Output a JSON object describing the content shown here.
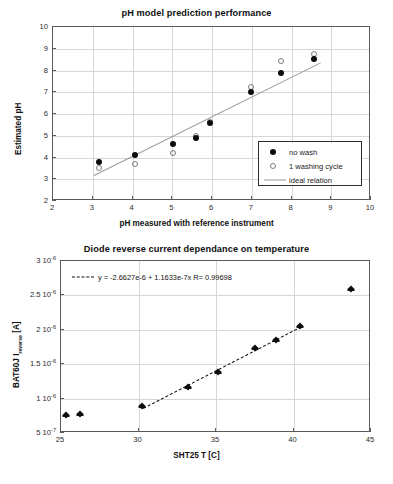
{
  "chart_data": [
    {
      "type": "scatter",
      "title": "pH model prediction performance",
      "xlabel": "pH measured with reference instrument",
      "ylabel": "Estimated pH",
      "xlim": [
        2,
        10
      ],
      "ylim": [
        2,
        10
      ],
      "xticks": [
        "2",
        "3",
        "4",
        "5",
        "6",
        "7",
        "8",
        "9",
        "10"
      ],
      "yticks": [
        "2",
        "3",
        "4",
        "5",
        "6",
        "7",
        "8",
        "9",
        "10"
      ],
      "grid": true,
      "legend_position": "lower-right",
      "series": [
        {
          "name": "no wash",
          "marker": "filled-circle",
          "points": [
            {
              "x": 3.15,
              "y": 3.79
            },
            {
              "x": 4.07,
              "y": 4.11
            },
            {
              "x": 5.01,
              "y": 4.6
            },
            {
              "x": 5.6,
              "y": 4.88
            },
            {
              "x": 5.94,
              "y": 5.59
            },
            {
              "x": 6.97,
              "y": 7.01
            },
            {
              "x": 7.73,
              "y": 7.88
            },
            {
              "x": 8.57,
              "y": 8.54
            }
          ]
        },
        {
          "name": "1 washing cycle",
          "marker": "open-circle",
          "points": [
            {
              "x": 3.15,
              "y": 3.52
            },
            {
              "x": 4.07,
              "y": 3.72
            },
            {
              "x": 5.01,
              "y": 4.21
            },
            {
              "x": 5.6,
              "y": 4.97
            },
            {
              "x": 5.94,
              "y": 5.65
            },
            {
              "x": 6.97,
              "y": 7.26
            },
            {
              "x": 7.73,
              "y": 8.42
            },
            {
              "x": 8.57,
              "y": 8.78
            }
          ]
        },
        {
          "name": "ideal relation",
          "marker": "line",
          "points": [
            {
              "x": 3.04,
              "y": 3.2
            },
            {
              "x": 8.73,
              "y": 8.37
            }
          ]
        }
      ]
    },
    {
      "type": "scatter",
      "title": "Diode reverse current dependance on temperature",
      "xlabel": "SHT25 T [C]",
      "ylabel": "BAT60J I reverse [A]",
      "ylabel_main": "BAT60J  I",
      "ylabel_sub": "reverse",
      "ylabel_unit": "[A]",
      "xlim": [
        25,
        45
      ],
      "ylim": [
        5e-07,
        3e-06
      ],
      "xticks": [
        "25",
        "30",
        "35",
        "40",
        "45"
      ],
      "yticks": [
        {
          "label_mantissa": "3",
          "label_exp": "-6",
          "value": 3e-06
        },
        {
          "label_mantissa": "2.5",
          "label_exp": "-6",
          "value": 2.5e-06
        },
        {
          "label_mantissa": "2",
          "label_exp": "-6",
          "value": 2e-06
        },
        {
          "label_mantissa": "1.5",
          "label_exp": "-6",
          "value": 1.5e-06
        },
        {
          "label_mantissa": "1",
          "label_exp": "-6",
          "value": 1e-06
        },
        {
          "label_mantissa": "5",
          "label_exp": "-7",
          "value": 5e-07
        }
      ],
      "grid": true,
      "annotation": "y = -2.6627e-6 + 1.1633e-7x   R= 0.99698",
      "fit": {
        "intercept": -2.6627e-06,
        "slope": 1.1633e-07,
        "r": 0.99698,
        "x_start": 30.3,
        "x_end": 40.5
      },
      "series": [
        {
          "name": "BAT60J reverse current",
          "marker": "filled-diamond",
          "points": [
            {
              "x": 25.3,
              "y": 7.6e-07
            },
            {
              "x": 26.2,
              "y": 7.7e-07
            },
            {
              "x": 30.2,
              "y": 8.9e-07
            },
            {
              "x": 33.2,
              "y": 1.17e-06
            },
            {
              "x": 35.1,
              "y": 1.39e-06
            },
            {
              "x": 37.5,
              "y": 1.73e-06
            },
            {
              "x": 38.9,
              "y": 1.85e-06
            },
            {
              "x": 40.4,
              "y": 2.05e-06
            },
            {
              "x": 43.7,
              "y": 2.6e-06
            }
          ]
        }
      ]
    }
  ],
  "figures": {
    "ph": {
      "title": "pH model prediction performance",
      "xlabel": "pH measured with reference instrument",
      "ylabel": "Estimated pH",
      "legend": [
        {
          "label": "no wash",
          "marker": "filled-circle"
        },
        {
          "label": "1 washing cycle",
          "marker": "open-circle"
        },
        {
          "label": "ideal relation",
          "marker": "line"
        }
      ]
    },
    "diode": {
      "title": "Diode reverse current dependance on temperature",
      "xlabel": "SHT25 T [C]",
      "ylabel_main": "BAT60J  I",
      "ylabel_sub": "reverse",
      "ylabel_unit": " [A]",
      "annotation": "y = -2.6627e-6 + 1.1633e-7x   R= 0.99698"
    }
  },
  "colors": {
    "marker_filled": "#0c0c0c",
    "marker_open_stroke": "#7d7d7d",
    "ideal_line": "#9a9a9a",
    "grid": "#d6d6d6",
    "frame": "#5a5a5a",
    "text": "#1a1a1a"
  }
}
